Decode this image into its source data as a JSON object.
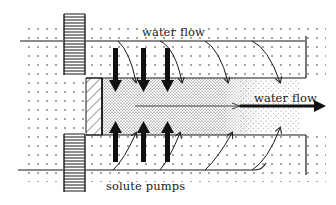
{
  "diagram": {
    "labels": {
      "water_flow_top": "water flow",
      "water_flow_right": "water flow",
      "solute_pumps": "solute pumps"
    },
    "colors": {
      "ink": "#1a1a1a",
      "background": "#ffffff"
    },
    "elements": {
      "coils": 2,
      "down_arrows": 3,
      "up_arrows": 3,
      "curved_flow_arrows_top": 3,
      "curved_flow_arrows_bottom": 3
    }
  }
}
